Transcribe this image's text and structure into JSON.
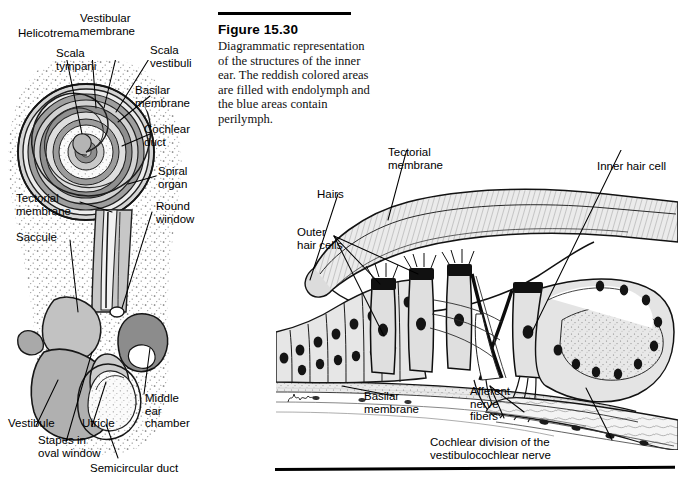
{
  "figure": {
    "number": "Figure 15.30",
    "caption": "Diagrammatic representation of the structures of the inner ear. The reddish colored areas are filled with endolymph and the blue areas contain perilymph.",
    "artist_signature": "Miller"
  },
  "colors": {
    "ink": "#000000",
    "bone_stipple": "#e9e9e9",
    "light_gray": "#d9d9d9",
    "mid_gray": "#bdbdbd",
    "dark_gray": "#9a9a9a",
    "darkest_gray": "#7d7d7d",
    "tectorial_fill": "#e4e4e4",
    "cell_fill": "#e0e0e0",
    "nucleus": "#1a1a1a",
    "paper": "#ffffff"
  },
  "left_panel": {
    "name": "cochlea-and-vestibule-section",
    "labels": [
      {
        "id": "helicotrema",
        "text": "Helicotrema",
        "x": 18,
        "y": 27,
        "align": "left"
      },
      {
        "id": "scala-tympani",
        "text": "Scala\ntympani",
        "x": 56,
        "y": 47,
        "align": "left"
      },
      {
        "id": "vestibular-membrane",
        "text": "Vestibular\nmembrane",
        "x": 80,
        "y": 12,
        "align": "left"
      },
      {
        "id": "scala-vestibuli",
        "text": "Scala\nvestibuli",
        "x": 150,
        "y": 44,
        "align": "left"
      },
      {
        "id": "basilar-membrane",
        "text": "Basilar\nmembrane",
        "x": 135,
        "y": 84,
        "align": "left"
      },
      {
        "id": "cochlear-duct",
        "text": "Cochlear\nduct",
        "x": 144,
        "y": 123,
        "align": "left"
      },
      {
        "id": "spiral-organ",
        "text": "Spiral\norgan",
        "x": 158,
        "y": 165,
        "align": "left"
      },
      {
        "id": "tectorial-membrane",
        "text": "Tectorial\nmembrane",
        "x": 16,
        "y": 192,
        "align": "left"
      },
      {
        "id": "round-window",
        "text": "Round\nwindow",
        "x": 156,
        "y": 200,
        "align": "left"
      },
      {
        "id": "saccule",
        "text": "Saccule",
        "x": 16,
        "y": 231,
        "align": "left"
      },
      {
        "id": "middle-ear-chamber",
        "text": "Middle\near\nchamber",
        "x": 145,
        "y": 392,
        "align": "left"
      },
      {
        "id": "vestibule",
        "text": "Vestibule",
        "x": 8,
        "y": 417,
        "align": "left"
      },
      {
        "id": "utricle",
        "text": "Utricle",
        "x": 82,
        "y": 417,
        "align": "left"
      },
      {
        "id": "stapes-oval-window",
        "text": "Stapes in\noval window",
        "x": 38,
        "y": 434,
        "align": "left"
      },
      {
        "id": "semicircular-duct",
        "text": "Semicircular duct",
        "x": 90,
        "y": 462,
        "align": "left"
      }
    ],
    "structures": [
      "cochlear spiral with 2.5 turns",
      "bony labyrinth stipple",
      "saccule",
      "utricle",
      "vestibule",
      "semicircular duct",
      "middle ear chamber",
      "stapes in oval window",
      "round window"
    ]
  },
  "right_panel": {
    "name": "organ-of-corti-detail",
    "labels": [
      {
        "id": "tectorial-membrane-r",
        "text": "Tectorial\nmembrane",
        "x": 388,
        "y": 146,
        "align": "left"
      },
      {
        "id": "inner-hair-cell",
        "text": "Inner hair cell",
        "x": 597,
        "y": 160,
        "align": "left"
      },
      {
        "id": "hairs",
        "text": "Hairs",
        "x": 317,
        "y": 188,
        "align": "left"
      },
      {
        "id": "outer-hair-cells",
        "text": "Outer\nhair cells",
        "x": 297,
        "y": 226,
        "align": "left"
      },
      {
        "id": "basilar-membrane-r",
        "text": "Basilar\nmembrane",
        "x": 364,
        "y": 390,
        "align": "left"
      },
      {
        "id": "afferent-nerve-fibers",
        "text": "Afferent\nnerve\nfibers",
        "x": 470,
        "y": 385,
        "align": "left"
      },
      {
        "id": "cochlear-division",
        "text": "Cochlear division of the\nvestibulocochlear nerve",
        "x": 430,
        "y": 436,
        "align": "left"
      }
    ],
    "structures": [
      "tectorial membrane",
      "outer hair cells row",
      "inner hair cell",
      "pillar cells / tunnel of Corti",
      "basilar membrane",
      "afferent nerve fibers",
      "cochlear nerve bundle",
      "supporting cells"
    ]
  }
}
